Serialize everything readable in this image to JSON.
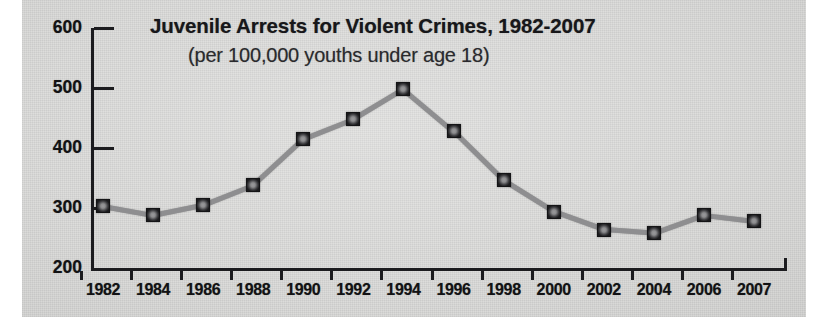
{
  "chart_data": {
    "type": "line",
    "title": "Juvenile Arrests for Violent Crimes, 1982-2007",
    "subtitle": "(per 100,000 youths under age 18)",
    "xlabel": "",
    "ylabel": "",
    "categories": [
      "1982",
      "1984",
      "1986",
      "1988",
      "1990",
      "1992",
      "1994",
      "1996",
      "1998",
      "2000",
      "2002",
      "2004",
      "2006",
      "2007"
    ],
    "values": [
      303,
      288,
      305,
      338,
      415,
      448,
      498,
      428,
      346,
      294,
      264,
      258,
      288,
      278
    ],
    "ylim": [
      200,
      600
    ],
    "yticks": [
      "200",
      "300",
      "400",
      "500",
      "600"
    ],
    "ytick_values": [
      200,
      300,
      400,
      500,
      600
    ],
    "grid": false,
    "legend": false,
    "marker": "square",
    "series_color": "#8e8e90",
    "marker_color": "#1a1a1c",
    "axis_color": "#1c1c1f",
    "background_color": "#dcdcda",
    "text_color": "#121214"
  }
}
